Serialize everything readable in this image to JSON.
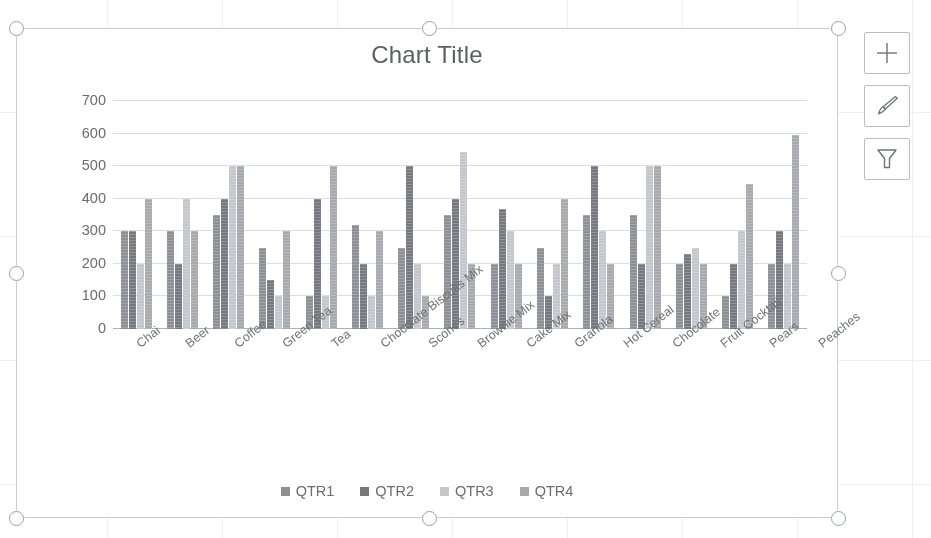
{
  "chart": {
    "title": "Chart Title",
    "legend_position": "bottom",
    "series_colors": [
      "#8c9095",
      "#75797e",
      "#c3c7cb",
      "#a6aaae"
    ]
  },
  "chart_data": {
    "type": "bar",
    "title": "Chart Title",
    "xlabel": "",
    "ylabel": "",
    "ylim": [
      0,
      700
    ],
    "yticks": [
      "0",
      "100",
      "200",
      "300",
      "400",
      "500",
      "600",
      "700"
    ],
    "grid": true,
    "legend": [
      "QTR1",
      "QTR2",
      "QTR3",
      "QTR4"
    ],
    "categories": [
      "Chai",
      "Beer",
      "Coffee",
      "Green Tea",
      "Tea",
      "Chocolate Biscuits Mix",
      "Scones",
      "Brownie Mix",
      "Cake Mix",
      "Granola",
      "Hot Cereal",
      "Chocolate",
      "Fruit Cocktail",
      "Pears",
      "Peaches"
    ],
    "series": [
      {
        "name": "QTR1",
        "values": [
          300,
          300,
          350,
          250,
          100,
          320,
          250,
          350,
          200,
          250,
          350,
          350,
          200,
          100,
          200
        ]
      },
      {
        "name": "QTR2",
        "values": [
          300,
          200,
          400,
          150,
          400,
          200,
          500,
          400,
          370,
          100,
          500,
          200,
          230,
          200,
          300
        ]
      },
      {
        "name": "QTR3",
        "values": [
          200,
          400,
          500,
          100,
          100,
          100,
          200,
          545,
          300,
          200,
          300,
          500,
          250,
          300,
          200
        ]
      },
      {
        "name": "QTR4",
        "values": [
          400,
          300,
          500,
          300,
          500,
          300,
          100,
          200,
          200,
          400,
          200,
          500,
          200,
          445,
          595
        ]
      }
    ]
  },
  "chart_tools": [
    {
      "name": "chart-elements",
      "icon": "plus-icon"
    },
    {
      "name": "chart-styles",
      "icon": "paintbrush-icon"
    },
    {
      "name": "chart-filters",
      "icon": "funnel-icon"
    }
  ],
  "selection": {
    "handles": [
      "top-left",
      "top-center",
      "top-right",
      "middle-left",
      "middle-right",
      "bottom-left",
      "bottom-center",
      "bottom-right"
    ]
  }
}
